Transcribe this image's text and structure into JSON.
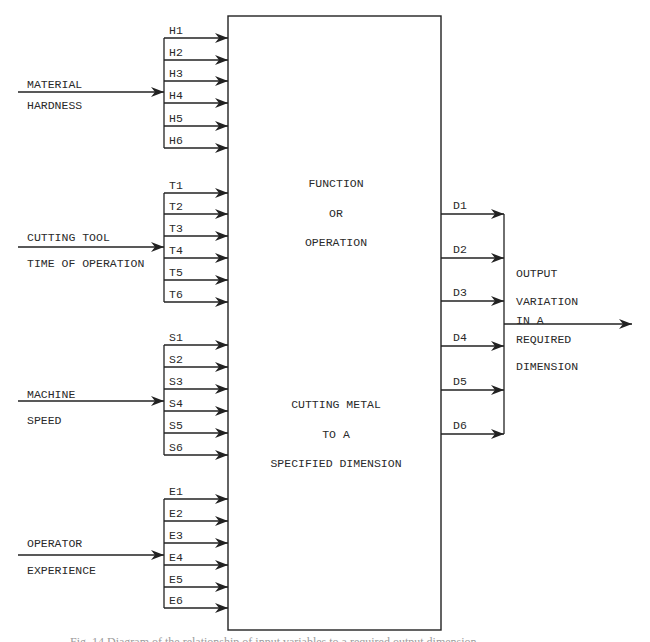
{
  "colors": {
    "line": "#222222",
    "text": "#2a2a2a",
    "background": "#ffffff"
  },
  "box": {
    "x": 228,
    "y": 16,
    "w": 213,
    "h": 614,
    "title_lines": [
      "FUNCTION",
      "OR",
      "OPERATION"
    ],
    "title_y": [
      187,
      217,
      246
    ],
    "subtitle_lines": [
      "CUTTING METAL",
      "TO A",
      "SPECIFIED DIMENSION"
    ],
    "subtitle_y": [
      408,
      438,
      467
    ],
    "center_x": 336
  },
  "input_groups": [
    {
      "id": "material-hardness",
      "label_lines": [
        "MATERIAL",
        "HARDNESS"
      ],
      "label_y": [
        88,
        109
      ],
      "main_y": 92,
      "bus_x": 164,
      "branches": [
        {
          "label": "H1",
          "y": 38
        },
        {
          "label": "H2",
          "y": 60
        },
        {
          "label": "H3",
          "y": 81
        },
        {
          "label": "H4",
          "y": 103
        },
        {
          "label": "H5",
          "y": 126
        },
        {
          "label": "H6",
          "y": 148
        }
      ]
    },
    {
      "id": "cutting-tool-time",
      "label_lines": [
        "CUTTING TOOL",
        "TIME OF OPERATION"
      ],
      "label_y": [
        241,
        267
      ],
      "main_y": 247,
      "bus_x": 164,
      "branches": [
        {
          "label": "T1",
          "y": 193
        },
        {
          "label": "T2",
          "y": 214
        },
        {
          "label": "T3",
          "y": 236
        },
        {
          "label": "T4",
          "y": 258
        },
        {
          "label": "T5",
          "y": 280
        },
        {
          "label": "T6",
          "y": 302
        }
      ]
    },
    {
      "id": "machine-speed",
      "label_lines": [
        "MACHINE",
        "SPEED"
      ],
      "label_y": [
        398,
        424
      ],
      "main_y": 401,
      "bus_x": 164,
      "branches": [
        {
          "label": "S1",
          "y": 345
        },
        {
          "label": "S2",
          "y": 367
        },
        {
          "label": "S3",
          "y": 389
        },
        {
          "label": "S4",
          "y": 411
        },
        {
          "label": "S5",
          "y": 433
        },
        {
          "label": "S6",
          "y": 455
        }
      ]
    },
    {
      "id": "operator-experience",
      "label_lines": [
        "OPERATOR",
        "EXPERIENCE"
      ],
      "label_y": [
        547,
        574
      ],
      "main_y": 555,
      "bus_x": 164,
      "branches": [
        {
          "label": "E1",
          "y": 499
        },
        {
          "label": "E2",
          "y": 521
        },
        {
          "label": "E3",
          "y": 543
        },
        {
          "label": "E4",
          "y": 565
        },
        {
          "label": "E5",
          "y": 587
        },
        {
          "label": "E6",
          "y": 608
        }
      ]
    }
  ],
  "outputs": {
    "bus_x": 504,
    "branches": [
      {
        "label": "D1",
        "y": 214
      },
      {
        "label": "D2",
        "y": 258
      },
      {
        "label": "D3",
        "y": 301
      },
      {
        "label": "D4",
        "y": 346
      },
      {
        "label": "D5",
        "y": 390
      },
      {
        "label": "D6",
        "y": 434
      }
    ],
    "main_y": 324,
    "arrow_end_x": 632,
    "label_lines": [
      "OUTPUT",
      "VARIATION",
      "IN A",
      "REQUIRED",
      "DIMENSION"
    ],
    "label_y": [
      277,
      305,
      324,
      343,
      370
    ],
    "label_x": 516
  },
  "caption": "Fig. 14   Diagram of the relationship of input variables to a required output dimension"
}
